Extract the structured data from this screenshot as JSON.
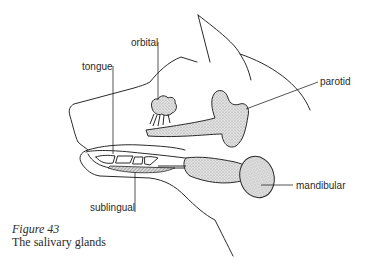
{
  "diagram": {
    "labels": {
      "orbital": "orbital",
      "tongue": "tongue",
      "parotid": "parotid",
      "sublingual": "sublingual",
      "mandibular": "mandibular"
    },
    "colors": {
      "line": "#2a2a2a",
      "gland_fill": "#d4d4d4",
      "background": "#ffffff"
    }
  },
  "caption": {
    "figure": "Figure 43",
    "title": "The salivary glands"
  }
}
